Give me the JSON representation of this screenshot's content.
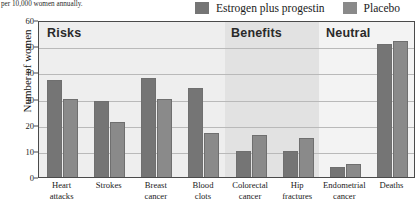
{
  "caption": {
    "text": "per 10,000 women annually."
  },
  "legend": {
    "items": [
      {
        "label": "Estrogen plus progestin",
        "color": "#757575"
      },
      {
        "label": "Placebo",
        "color": "#8a8a8a"
      }
    ]
  },
  "sections": [
    {
      "name": "Risks",
      "label": "Risks",
      "background": "#eeeeee"
    },
    {
      "name": "Benefits",
      "label": "Benefits",
      "background": "#e2e2e2"
    },
    {
      "name": "Neutral",
      "label": "Neutral",
      "background": "#f3f3f3"
    }
  ],
  "axis": {
    "y_title": "Number of women",
    "y_ticks": [
      "0",
      "10",
      "20",
      "30",
      "40",
      "50",
      "60"
    ]
  },
  "chart_data": {
    "type": "bar",
    "title": "",
    "subtitle": "per 10,000 women annually.",
    "xlabel": "",
    "ylabel": "Number of women",
    "ylim": [
      0,
      60
    ],
    "ytick_step": 10,
    "grid": true,
    "legend_position": "top-right",
    "categories": [
      "Heart attacks",
      "Strokes",
      "Breast cancer",
      "Blood clots",
      "Colorectal cancer",
      "Hip fractures",
      "Endometrial cancer",
      "Deaths"
    ],
    "category_lines": [
      [
        "Heart",
        "attacks"
      ],
      [
        "Strokes",
        ""
      ],
      [
        "Breast",
        "cancer"
      ],
      [
        "Blood",
        "clots"
      ],
      [
        "Colorectal",
        "cancer"
      ],
      [
        "Hip",
        "fractures"
      ],
      [
        "Endometrial",
        "cancer"
      ],
      [
        "Deaths",
        ""
      ]
    ],
    "category_sections": [
      "Risks",
      "Risks",
      "Risks",
      "Risks",
      "Benefits",
      "Benefits",
      "Neutral",
      "Neutral"
    ],
    "series": [
      {
        "name": "Estrogen plus progestin",
        "color": "#757575",
        "values": [
          37,
          29,
          38,
          34,
          10,
          10,
          4,
          51
        ]
      },
      {
        "name": "Placebo",
        "color": "#8a8a8a",
        "values": [
          30,
          21,
          30,
          17,
          16,
          15,
          5,
          52
        ]
      }
    ]
  }
}
